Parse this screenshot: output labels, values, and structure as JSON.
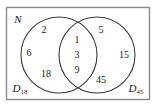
{
  "figure": {
    "type": "venn-diagram",
    "universal_set_label": "N",
    "left_set": {
      "label_base": "D",
      "label_subscript": "18",
      "label_full": "D18",
      "only_members": [
        "2",
        "6",
        "18"
      ]
    },
    "right_set": {
      "label_base": "D",
      "label_subscript": "45",
      "label_full": "D45",
      "only_members": [
        "5",
        "15",
        "45"
      ]
    },
    "intersection_members": [
      "1",
      "3",
      "9"
    ],
    "colors": {
      "stroke": "#3a3a3a",
      "frame": "#8a8a8a",
      "text": "#1a1a1a",
      "background": "#ffffff"
    },
    "regions": {
      "left_only": {
        "2": "2",
        "6": "6",
        "18": "18"
      },
      "center": {
        "1": "1",
        "3": "3",
        "9": "9"
      },
      "right_only": {
        "5": "5",
        "15": "15",
        "45": "45"
      }
    }
  }
}
